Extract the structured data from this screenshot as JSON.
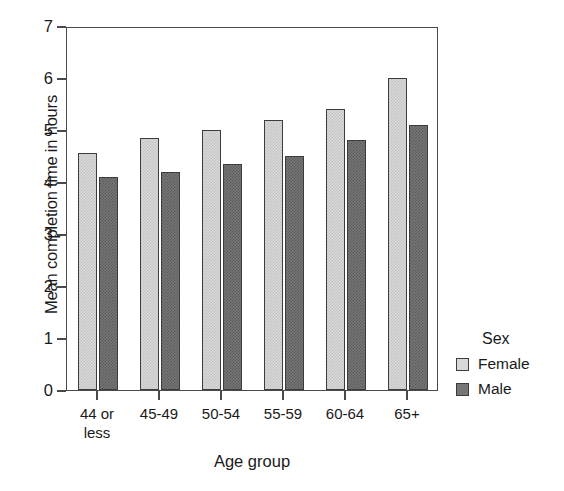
{
  "chart_data": {
    "type": "bar",
    "title": "",
    "xlabel": "Age group",
    "ylabel": "Mean completion time in hours",
    "categories": [
      "44 or\nless",
      "45-49",
      "50-54",
      "55-59",
      "60-64",
      "65+"
    ],
    "series": [
      {
        "name": "Female",
        "values": [
          4.55,
          4.85,
          5.0,
          5.2,
          5.4,
          6.0
        ],
        "color": "#d8d8d8"
      },
      {
        "name": "Male",
        "values": [
          4.1,
          4.2,
          4.35,
          4.5,
          4.8,
          5.1
        ],
        "color": "#767676"
      }
    ],
    "ylim": [
      0,
      7
    ],
    "yticks": [
      0,
      1,
      2,
      3,
      4,
      5,
      6,
      7
    ],
    "ytick_labels": [
      "0",
      "1",
      "2",
      "3",
      "4",
      "5",
      "6",
      "7"
    ],
    "grid": false,
    "legend": {
      "title": "Sex",
      "position": "right",
      "entries": [
        "Female",
        "Male"
      ]
    }
  }
}
